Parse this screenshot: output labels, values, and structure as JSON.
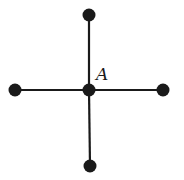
{
  "diagram": {
    "type": "star-graph",
    "colors": {
      "stroke": "#1a1a1a",
      "node": "#1a1a1a",
      "background": "#ffffff"
    },
    "center": {
      "id": "A",
      "label": "A",
      "x": 89,
      "y": 90
    },
    "nodes": [
      {
        "id": "top",
        "x": 89,
        "y": 15
      },
      {
        "id": "left",
        "x": 15,
        "y": 90
      },
      {
        "id": "right",
        "x": 163,
        "y": 90
      },
      {
        "id": "bottom",
        "x": 90,
        "y": 166
      }
    ],
    "edges": [
      {
        "from": "A",
        "to": "top"
      },
      {
        "from": "A",
        "to": "left"
      },
      {
        "from": "A",
        "to": "right"
      },
      {
        "from": "A",
        "to": "bottom"
      }
    ],
    "label_position": {
      "x": 96,
      "y": 80
    }
  }
}
